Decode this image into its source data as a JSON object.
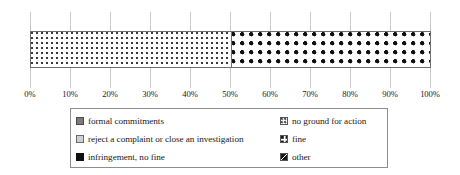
{
  "chart_data": {
    "type": "bar",
    "orientation": "horizontal",
    "stacked": true,
    "title": "",
    "xlabel": "",
    "ylabel": "",
    "categories": [
      ""
    ],
    "xlim": [
      0,
      100
    ],
    "grid": true,
    "legend_position": "bottom",
    "x_tick_labels": [
      "0%",
      "10%",
      "20%",
      "30%",
      "40%",
      "50%",
      "60%",
      "70%",
      "80%",
      "90%",
      "100%"
    ],
    "x_tick_values": [
      0,
      10,
      20,
      30,
      40,
      50,
      60,
      70,
      80,
      90,
      100
    ],
    "series": [
      {
        "name": "formal commitments",
        "values": [
          0
        ],
        "swatch": "solid-darkgray",
        "color": "#7b7b7b"
      },
      {
        "name": "reject a complaint or close an investigation",
        "values": [
          0
        ],
        "swatch": "solid-lightgray",
        "color": "#cfcfcf"
      },
      {
        "name": "infringement, no fine",
        "values": [
          0
        ],
        "swatch": "solid-black",
        "color": "#101010"
      },
      {
        "name": "no ground for action",
        "values": [
          50
        ],
        "swatch": "fine-dots",
        "color": "#3a3a3a"
      },
      {
        "name": "fine",
        "values": [
          50
        ],
        "swatch": "bold-dots",
        "color": "#111111"
      },
      {
        "name": "other",
        "values": [
          0
        ],
        "swatch": "diagonal",
        "color": "#1a1a1a"
      }
    ],
    "visible_segments": [
      {
        "label": "no ground for action",
        "start": 0,
        "end": 50,
        "value": 50,
        "swatch": "fine-dots"
      },
      {
        "label": "fine",
        "start": 50,
        "end": 100,
        "value": 50,
        "swatch": "bold-dots"
      }
    ]
  },
  "axis": {
    "ticks": [
      {
        "label": "0%",
        "value": 0
      },
      {
        "label": "10%",
        "value": 10
      },
      {
        "label": "20%",
        "value": 20
      },
      {
        "label": "30%",
        "value": 30
      },
      {
        "label": "40%",
        "value": 40
      },
      {
        "label": "50%",
        "value": 50
      },
      {
        "label": "60%",
        "value": 60
      },
      {
        "label": "70%",
        "value": 70
      },
      {
        "label": "80%",
        "value": 80
      },
      {
        "label": "90%",
        "value": 90
      },
      {
        "label": "100%",
        "value": 100
      }
    ]
  },
  "legend": {
    "left_column": [
      {
        "label": "formal commitments",
        "swatch": "solid-darkgray"
      },
      {
        "label": "reject a complaint or close an investigation",
        "swatch": "solid-lightgray"
      },
      {
        "label": "infringement, no fine",
        "swatch": "solid-black"
      }
    ],
    "right_column": [
      {
        "label": "no ground for action",
        "swatch": "fine-dots"
      },
      {
        "label": "fine",
        "swatch": "bold-dots"
      },
      {
        "label": "other",
        "swatch": "diagonal"
      }
    ]
  },
  "colors": {
    "border": "#6d6d6d",
    "gridline": "#c9c9c9",
    "legend_border": "#8d8d8d",
    "text": "#1a1a1a",
    "background": "#ffffff"
  }
}
